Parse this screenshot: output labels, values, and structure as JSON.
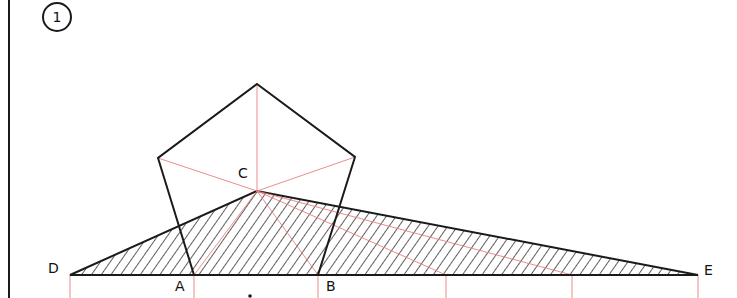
{
  "figure": {
    "step_number": "1",
    "labels": {
      "A": "A",
      "B": "B",
      "C": "C",
      "D": "D",
      "E": "E"
    },
    "colors": {
      "ink": "#1a1a1a",
      "construction": "#e88080",
      "background": "#ffffff"
    },
    "points": {
      "A": [
        194,
        275
      ],
      "B": [
        318,
        275
      ],
      "C": [
        257,
        191
      ],
      "D": [
        70,
        275
      ],
      "E": [
        698,
        275
      ],
      "P_top": [
        257,
        84
      ],
      "P_left": [
        158,
        158
      ],
      "P_right": [
        355,
        157
      ]
    },
    "tick_positions_x": [
      70,
      194,
      318,
      446,
      572,
      698
    ]
  }
}
